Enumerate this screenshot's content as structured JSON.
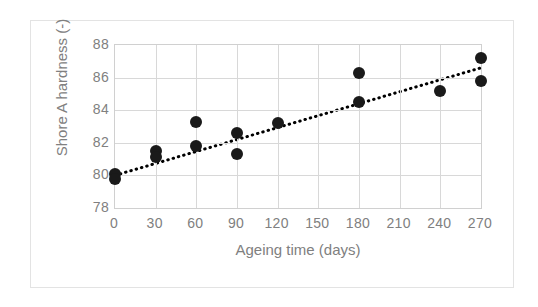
{
  "chart_data": {
    "type": "scatter",
    "title": "",
    "xlabel": "Ageing time (days)",
    "ylabel": "Shore A hardness (-)",
    "xlim": [
      0,
      270
    ],
    "ylim": [
      78,
      88
    ],
    "xticks": [
      0,
      30,
      60,
      90,
      120,
      150,
      180,
      210,
      240,
      270
    ],
    "yticks": [
      78,
      80,
      82,
      84,
      86,
      88
    ],
    "grid": true,
    "legend": "none",
    "marker_color": "#1a1a1a",
    "trendline_color": "#000000",
    "trendline_style": "dotted",
    "points": [
      {
        "x": 0,
        "y": 80.1
      },
      {
        "x": 0,
        "y": 79.8
      },
      {
        "x": 30,
        "y": 81.5
      },
      {
        "x": 30,
        "y": 81.1
      },
      {
        "x": 60,
        "y": 83.3
      },
      {
        "x": 60,
        "y": 81.8
      },
      {
        "x": 90,
        "y": 82.6
      },
      {
        "x": 90,
        "y": 81.3
      },
      {
        "x": 120,
        "y": 83.2
      },
      {
        "x": 180,
        "y": 86.3
      },
      {
        "x": 180,
        "y": 84.5
      },
      {
        "x": 240,
        "y": 85.2
      },
      {
        "x": 270,
        "y": 87.2
      },
      {
        "x": 270,
        "y": 85.8
      }
    ],
    "trendline": {
      "x": [
        0,
        270
      ],
      "y": [
        80.0,
        86.6
      ]
    }
  }
}
